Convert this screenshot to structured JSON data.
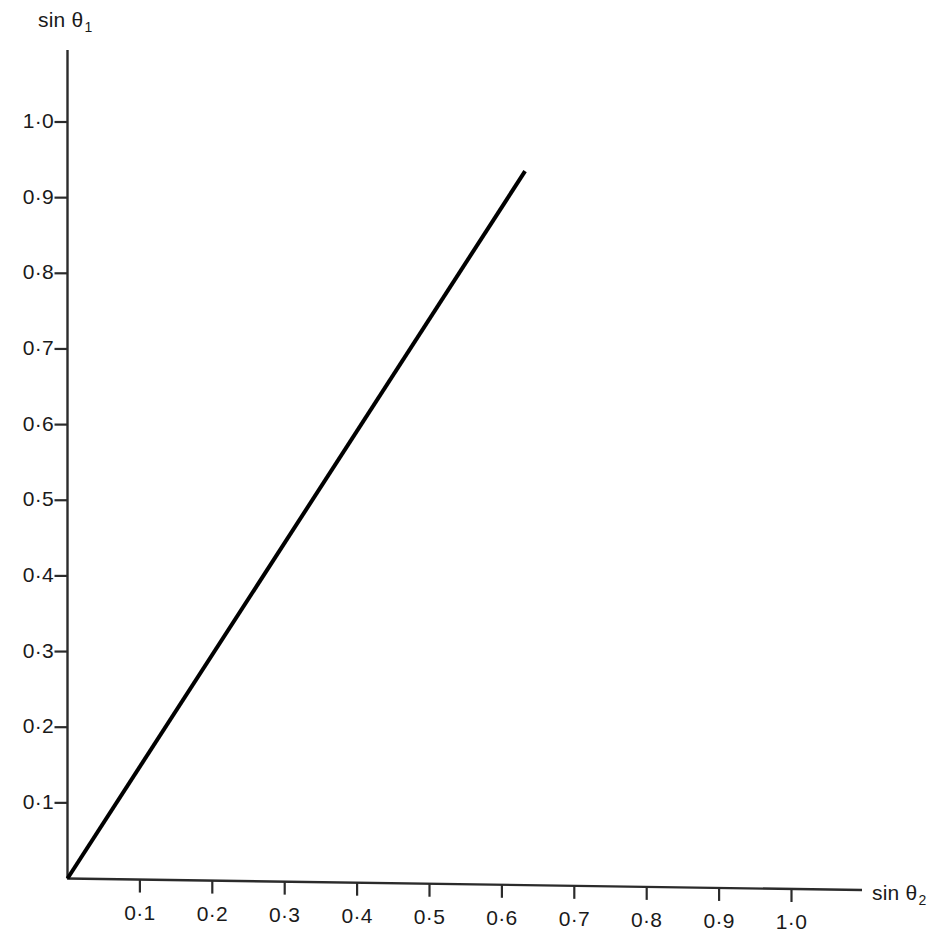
{
  "figure": {
    "background_color": "#ffffff",
    "ink_color": "#1a1a1a",
    "width": 943,
    "height": 936
  },
  "axes": {
    "y": {
      "title": "sin",
      "title_symbol": "θ",
      "title_subscript": "1",
      "title_full": "sin θ₁",
      "tick_labels": [
        "0·1",
        "0·2",
        "0·3",
        "0·4",
        "0·5",
        "0·6",
        "0·7",
        "0·8",
        "0·9",
        "1·0"
      ],
      "tick_values": [
        0.1,
        0.2,
        0.3,
        0.4,
        0.5,
        0.6,
        0.7,
        0.8,
        0.9,
        1.0
      ]
    },
    "x": {
      "title": "sin",
      "title_symbol": "θ",
      "title_subscript": "2",
      "title_full": "sin θ₂",
      "tick_labels": [
        "0·1",
        "0·2",
        "0·3",
        "0·4",
        "0·5",
        "0·6",
        "0·7",
        "0·8",
        "0·9",
        "1·0"
      ],
      "tick_values": [
        0.1,
        0.2,
        0.3,
        0.4,
        0.5,
        0.6,
        0.7,
        0.8,
        0.9,
        1.0
      ]
    }
  },
  "chart_data": {
    "type": "line",
    "title": "",
    "subtitle": "",
    "xlabel": "sin θ₂",
    "ylabel": "sin θ₁",
    "xlim": [
      0.0,
      1.1
    ],
    "ylim": [
      0.0,
      1.1
    ],
    "xticks": [
      0.1,
      0.2,
      0.3,
      0.4,
      0.5,
      0.6,
      0.7,
      0.8,
      0.9,
      1.0
    ],
    "yticks": [
      0.1,
      0.2,
      0.3,
      0.4,
      0.5,
      0.6,
      0.7,
      0.8,
      0.9,
      1.0
    ],
    "xtick_labels": [
      "0·1",
      "0·2",
      "0·3",
      "0·4",
      "0·5",
      "0·6",
      "0·7",
      "0·8",
      "0·9",
      "1·0"
    ],
    "ytick_labels": [
      "0·1",
      "0·2",
      "0·3",
      "0·4",
      "0·5",
      "0·6",
      "0·7",
      "0·8",
      "0·9",
      "1·0"
    ],
    "grid": false,
    "legend": false,
    "legend_position": "none",
    "series": [
      {
        "name": "sin θ₁ vs sin θ₂",
        "color": "#000000",
        "line_width": 4,
        "x": [
          0.0,
          0.632
        ],
        "y": [
          0.0,
          0.935
        ],
        "slope": 1.48
      }
    ],
    "annotations": []
  }
}
